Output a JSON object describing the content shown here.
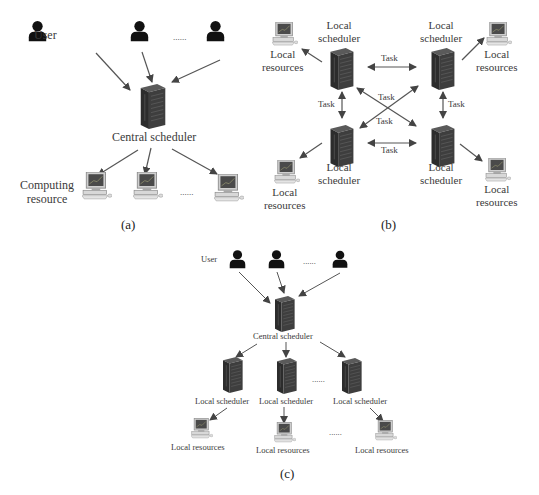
{
  "figure": {
    "panel_a": {
      "caption": "(a)",
      "user_label": "User",
      "ellipsis": "......",
      "central_label": "Central scheduler",
      "resource_label_line1": "Computing",
      "resource_label_line2": "resource",
      "users_count_shown": 3,
      "resources_count_shown": 3
    },
    "panel_b": {
      "caption": "(b)",
      "scheduler_line1": "Local",
      "scheduler_line2": "scheduler",
      "resources_line1": "Local",
      "resources_line2": "resources",
      "edge_label": "Task",
      "nodes": [
        {
          "id": "top-left",
          "label": "Local scheduler",
          "resource": "Local resources"
        },
        {
          "id": "top-right",
          "label": "Local scheduler",
          "resource": "Local resources"
        },
        {
          "id": "bottom-left",
          "label": "Local scheduler",
          "resource": "Local resources"
        },
        {
          "id": "bottom-right",
          "label": "Local scheduler",
          "resource": "Local resources"
        }
      ],
      "edges": [
        {
          "from": "top-left",
          "to": "top-right",
          "label": "Task"
        },
        {
          "from": "top-left",
          "to": "bottom-left",
          "label": "Task"
        },
        {
          "from": "top-right",
          "to": "bottom-right",
          "label": "Task"
        },
        {
          "from": "bottom-left",
          "to": "bottom-right",
          "label": "Task"
        },
        {
          "from": "top-left",
          "to": "bottom-right",
          "label": "Task"
        },
        {
          "from": "top-right",
          "to": "bottom-left",
          "label": "Task"
        }
      ]
    },
    "panel_c": {
      "caption": "(c)",
      "user_label": "User",
      "ellipsis": "......",
      "central_label": "Central scheduler",
      "local_scheduler_label": "Local scheduler",
      "local_resources_label": "Local resources"
    },
    "colors": {
      "line": "#555555",
      "server": "#3a3a3a",
      "user": "#111111"
    }
  }
}
